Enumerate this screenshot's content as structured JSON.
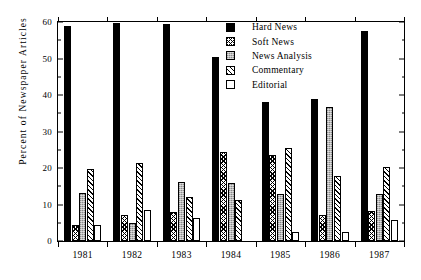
{
  "chart_data": {
    "type": "bar",
    "title": "",
    "xlabel": "",
    "ylabel": "Percent of Newspaper Articles",
    "ylim": [
      0,
      60
    ],
    "ytick_step": 10,
    "yticks": [
      0,
      10,
      20,
      30,
      40,
      50,
      60
    ],
    "ytick_labels": [
      "0",
      "10",
      "20",
      "30",
      "40",
      "50",
      "60"
    ],
    "yminor_ticks": [
      5,
      15,
      25,
      35,
      45,
      55
    ],
    "grid": false,
    "legend_position": "upper center",
    "categories": [
      "1981",
      "1982",
      "1983",
      "1984",
      "1985",
      "1986",
      "1987"
    ],
    "series": [
      {
        "name": "Hard News",
        "fill": "solid-black",
        "values": [
          59.0,
          59.8,
          59.5,
          50.3,
          38.0,
          39.0,
          57.5
        ]
      },
      {
        "name": "Soft News",
        "fill": "dark-cross-hatch",
        "values": [
          4.5,
          7.2,
          8.0,
          24.5,
          23.6,
          7.0,
          8.2
        ]
      },
      {
        "name": "News Analysis",
        "fill": "gray-stipple",
        "values": [
          13.2,
          4.8,
          16.1,
          15.8,
          13.0,
          36.7,
          12.8
        ]
      },
      {
        "name": "Commentary",
        "fill": "diagonal-hatch",
        "values": [
          19.7,
          21.3,
          12.0,
          11.3,
          25.6,
          17.9,
          20.2
        ]
      },
      {
        "name": "Editorial",
        "fill": "white-outline",
        "values": [
          4.5,
          8.4,
          6.2,
          0.0,
          2.4,
          2.6,
          5.8
        ]
      }
    ]
  },
  "legend": {
    "items": [
      {
        "label": "Hard News"
      },
      {
        "label": "Soft News"
      },
      {
        "label": "News Analysis"
      },
      {
        "label": "Commentary"
      },
      {
        "label": "Editorial"
      }
    ]
  },
  "axes": {
    "y_title": "Percent of Newspaper Articles"
  },
  "colors": {
    "axis": "#000000",
    "background": "#ffffff",
    "hard_news": "#000000",
    "news_analysis": "#b8b8b8",
    "editorial": "#ffffff"
  }
}
